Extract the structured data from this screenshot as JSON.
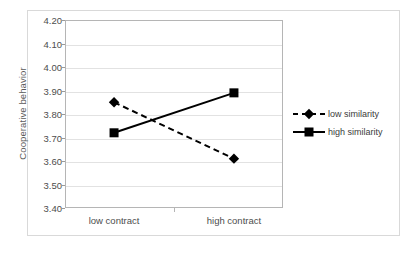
{
  "chart_data": {
    "type": "line",
    "title": "",
    "subtitle": "",
    "xlabel": "",
    "ylabel": "Cooperative behavior",
    "categories": [
      "low contract",
      "high contract"
    ],
    "series": [
      {
        "name": "low similarity",
        "values": [
          3.85,
          3.61
        ],
        "line_style": "dashed",
        "marker": "diamond",
        "color": "#000000"
      },
      {
        "name": "high similarity",
        "values": [
          3.72,
          3.89
        ],
        "line_style": "solid",
        "marker": "square",
        "color": "#000000"
      }
    ],
    "ylim": [
      3.4,
      4.2
    ],
    "ytick_labels": [
      "4.20",
      "4.10",
      "4.00",
      "3.90",
      "3.80",
      "3.70",
      "3.60",
      "3.50",
      "3.40"
    ],
    "ytick_values": [
      4.2,
      4.1,
      4.0,
      3.9,
      3.8,
      3.7,
      3.6,
      3.5,
      3.4
    ],
    "grid": true,
    "legend_position": "right",
    "legend_entries": [
      "low similarity",
      "high similarity"
    ],
    "colors": {
      "series": "#000000",
      "gridline": "#e2e2e2",
      "axis": "#b5b5b5",
      "frame": "#d9d9d9",
      "tick_text": "#4d4d4d",
      "axis_title_text": "#5a5a5a",
      "plot_background": "#ffffff"
    }
  },
  "axis": {
    "y_title": "Cooperative behavior",
    "y_ticks": [
      "4.20",
      "4.10",
      "4.00",
      "3.90",
      "3.80",
      "3.70",
      "3.60",
      "3.50",
      "3.40"
    ],
    "x_ticks": [
      "low contract",
      "high contract"
    ]
  },
  "legend": {
    "items": [
      {
        "label": "low similarity",
        "marker": "diamond",
        "style": "dashed"
      },
      {
        "label": "high similarity",
        "marker": "square",
        "style": "solid"
      }
    ]
  }
}
